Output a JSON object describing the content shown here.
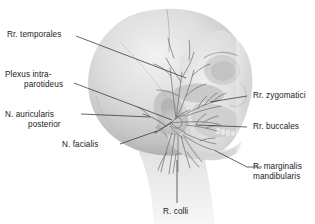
{
  "figure": {
    "background_color": "#ffffff",
    "text_color": "#1b1b1b",
    "leader_color": "#3a3a3a",
    "anatomy_gray_light": "#e6e6e6",
    "anatomy_gray_mid": "#c9c9c9",
    "anatomy_gray_dark": "#9a9a9a",
    "nerve_color": "#6e6e6e"
  },
  "labels": {
    "temporales": "Rr. temporales",
    "plexus_line1": "Plexus intra-",
    "plexus_line2": "parotideus",
    "auricularis_line1": "N. auricularis",
    "auricularis_line2": "posterior",
    "facialis": "N. facialis",
    "zygomatici": "Rr. zygomatici",
    "buccales": "Rr. buccales",
    "marginalis_line1": "R. marginalis",
    "marginalis_line2": "mandibularis",
    "colli": "R. colli"
  }
}
